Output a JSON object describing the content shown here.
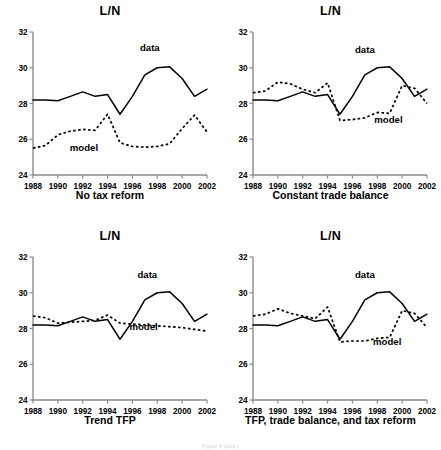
{
  "figure": {
    "caption": "Figure 4 (cont.)",
    "axis": {
      "ylim": [
        24,
        32
      ],
      "yticks": [
        24,
        26,
        28,
        30,
        32
      ],
      "xlim": [
        1988,
        2002
      ],
      "xticks": [
        1988,
        1990,
        1992,
        1994,
        1996,
        1998,
        2000,
        2002
      ],
      "grid": false
    },
    "series_labels": {
      "data": "data",
      "model": "model"
    }
  },
  "chart_data": [
    {
      "type": "line",
      "title": "L/N",
      "subtitle": "No tax reform",
      "xlabel": "",
      "ylabel": "L/N",
      "xlim": [
        1988,
        2002
      ],
      "ylim": [
        24,
        32
      ],
      "yticks": [
        24,
        26,
        28,
        30,
        32
      ],
      "xticks": [
        1988,
        1990,
        1992,
        1994,
        1996,
        1998,
        2000,
        2002
      ],
      "grid": false,
      "legend": "inline-annotations",
      "x": [
        1988,
        1989,
        1990,
        1991,
        1992,
        1993,
        1994,
        1995,
        1996,
        1997,
        1998,
        1999,
        2000,
        2001,
        2002
      ],
      "series": [
        {
          "name": "data",
          "style": "solid",
          "values": [
            28.2,
            28.2,
            28.15,
            28.4,
            28.65,
            28.4,
            28.5,
            27.4,
            28.4,
            29.6,
            30.0,
            30.05,
            29.4,
            28.4,
            28.8
          ]
        },
        {
          "name": "model",
          "style": "dashed",
          "values": [
            25.5,
            25.65,
            26.25,
            26.45,
            26.55,
            26.5,
            27.4,
            25.8,
            25.6,
            25.55,
            25.6,
            25.75,
            26.6,
            27.35,
            26.4
          ]
        }
      ],
      "annotations": [
        {
          "text": "data",
          "x": 1997.4,
          "y": 30.95
        },
        {
          "text": "model",
          "x": 1992.1,
          "y": 25.35
        }
      ]
    },
    {
      "type": "line",
      "title": "L/N",
      "subtitle": "Constant trade balance",
      "xlabel": "",
      "ylabel": "L/N",
      "xlim": [
        1988,
        2002
      ],
      "ylim": [
        24,
        32
      ],
      "yticks": [
        24,
        26,
        28,
        30,
        32
      ],
      "xticks": [
        1988,
        1990,
        1992,
        1994,
        1996,
        1998,
        2000,
        2002
      ],
      "grid": false,
      "legend": "inline-annotations",
      "x": [
        1988,
        1989,
        1990,
        1991,
        1992,
        1993,
        1994,
        1995,
        1996,
        1997,
        1998,
        1999,
        2000,
        2001,
        2002
      ],
      "series": [
        {
          "name": "data",
          "style": "solid",
          "values": [
            28.2,
            28.2,
            28.15,
            28.4,
            28.65,
            28.4,
            28.5,
            27.4,
            28.4,
            29.6,
            30.0,
            30.05,
            29.4,
            28.4,
            28.8
          ]
        },
        {
          "name": "model",
          "style": "dashed",
          "values": [
            28.6,
            28.7,
            29.2,
            29.1,
            28.8,
            28.6,
            29.15,
            27.05,
            27.1,
            27.2,
            27.5,
            27.45,
            29.0,
            28.85,
            28.0
          ]
        }
      ],
      "annotations": [
        {
          "text": "data",
          "x": 1997.0,
          "y": 30.8
        },
        {
          "text": "model",
          "x": 1998.9,
          "y": 26.9
        }
      ]
    },
    {
      "type": "line",
      "title": "L/N",
      "subtitle": "Trend TFP",
      "xlabel": "",
      "ylabel": "L/N",
      "xlim": [
        1988,
        2002
      ],
      "ylim": [
        24,
        32
      ],
      "yticks": [
        24,
        26,
        28,
        30,
        32
      ],
      "xticks": [
        1988,
        1990,
        1992,
        1994,
        1996,
        1998,
        2000,
        2002
      ],
      "grid": false,
      "legend": "inline-annotations",
      "x": [
        1988,
        1989,
        1990,
        1991,
        1992,
        1993,
        1994,
        1995,
        1996,
        1997,
        1998,
        1999,
        2000,
        2001,
        2002
      ],
      "series": [
        {
          "name": "data",
          "style": "solid",
          "values": [
            28.2,
            28.2,
            28.15,
            28.4,
            28.65,
            28.4,
            28.5,
            27.4,
            28.4,
            29.6,
            30.0,
            30.05,
            29.4,
            28.4,
            28.8
          ]
        },
        {
          "name": "model",
          "style": "dashed",
          "values": [
            28.7,
            28.6,
            28.3,
            28.35,
            28.4,
            28.45,
            28.75,
            28.3,
            28.25,
            28.2,
            28.15,
            28.1,
            28.05,
            27.95,
            27.85
          ]
        }
      ],
      "annotations": [
        {
          "text": "data",
          "x": 1997.2,
          "y": 30.8
        },
        {
          "text": "model",
          "x": 1996.9,
          "y": 27.9
        }
      ]
    },
    {
      "type": "line",
      "title": "L/N",
      "subtitle": "TFP, trade balance, and tax reform",
      "xlabel": "",
      "ylabel": "L/N",
      "xlim": [
        1988,
        2002
      ],
      "ylim": [
        24,
        32
      ],
      "yticks": [
        24,
        26,
        28,
        30,
        32
      ],
      "xticks": [
        1988,
        1990,
        1992,
        1994,
        1996,
        1998,
        2000,
        2002
      ],
      "grid": false,
      "legend": "inline-annotations",
      "x": [
        1988,
        1989,
        1990,
        1991,
        1992,
        1993,
        1994,
        1995,
        1996,
        1997,
        1998,
        1999,
        2000,
        2001,
        2002
      ],
      "series": [
        {
          "name": "data",
          "style": "solid",
          "values": [
            28.2,
            28.2,
            28.15,
            28.4,
            28.65,
            28.4,
            28.5,
            27.4,
            28.4,
            29.6,
            30.0,
            30.05,
            29.4,
            28.4,
            28.8
          ]
        },
        {
          "name": "model",
          "style": "dashed",
          "values": [
            28.7,
            28.8,
            29.1,
            28.85,
            28.7,
            28.55,
            29.2,
            27.25,
            27.3,
            27.3,
            27.45,
            27.5,
            29.0,
            28.85,
            28.05
          ]
        }
      ],
      "annotations": [
        {
          "text": "data",
          "x": 1997.0,
          "y": 30.8
        },
        {
          "text": "model",
          "x": 1998.8,
          "y": 27.1
        }
      ]
    }
  ]
}
